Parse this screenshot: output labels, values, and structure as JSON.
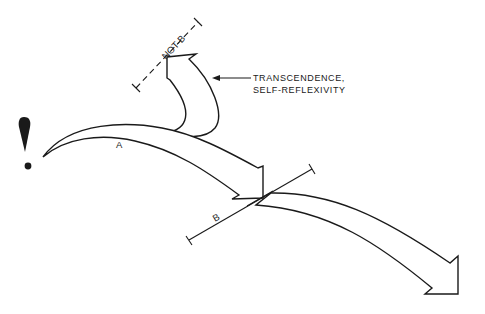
{
  "diagram": {
    "start_symbol": "!",
    "arrows": [
      {
        "id": "A",
        "label": "A"
      },
      {
        "id": "B",
        "label": "B"
      },
      {
        "id": "transcendence",
        "label": ""
      }
    ],
    "annotations": {
      "not_b": "NOT-B",
      "transcendence_line1": "TRANSCENDENCE,",
      "transcendence_line2": "SELF-REFLEXIVITY"
    },
    "colors": {
      "ink": "#1a1a1a",
      "background": "#ffffff"
    }
  }
}
